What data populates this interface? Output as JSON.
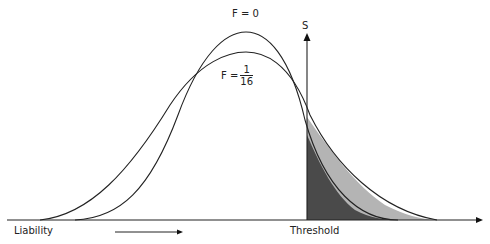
{
  "diagram": {
    "curves": [
      {
        "name": "F = 0",
        "label": "F = 0",
        "peak_x": 246,
        "peak_y": 32
      },
      {
        "name": "F = 1/16",
        "label_prefix": "F =",
        "numerator": "1",
        "denominator": "16",
        "peak_x": 246,
        "peak_y": 52
      }
    ],
    "axis": {
      "x_label": "Liability",
      "threshold_label": "Threshold",
      "s_label": "S"
    },
    "colors": {
      "dark_fill": "#4a4a4a",
      "light_fill": "#b4b4b4",
      "line": "#222222"
    }
  }
}
